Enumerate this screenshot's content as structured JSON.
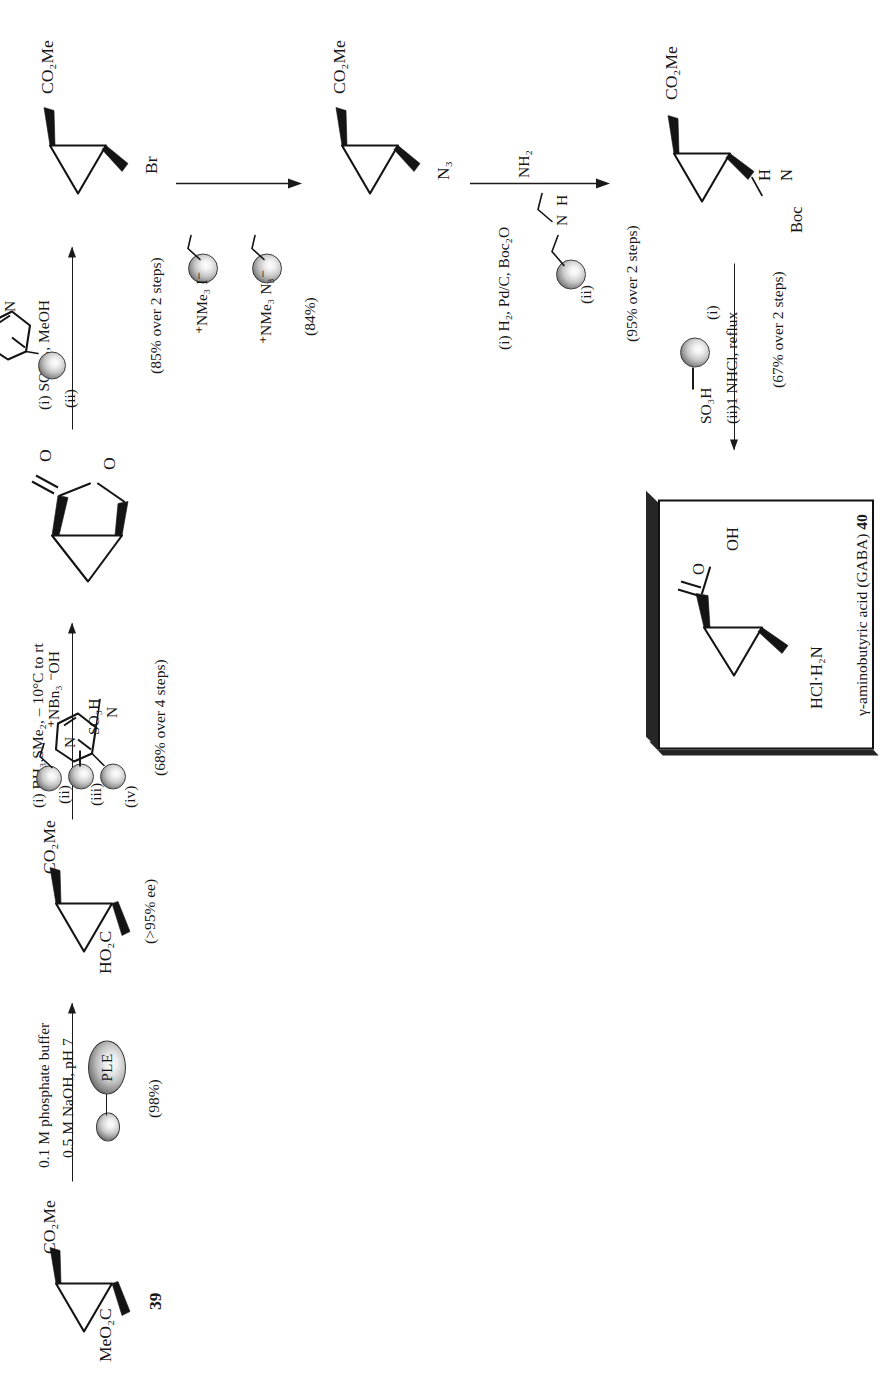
{
  "scheme": {
    "type": "reaction-scheme",
    "title": "Solid-phase synthesis of a GABA analogue",
    "orientation_deg": -90,
    "compounds": [
      {
        "id": "39",
        "label": "39",
        "name": "dimethyl cyclopropane-1,2-dicarboxylate",
        "left_substituent": "MeO2C",
        "right_substituent": "CO2Me",
        "left_substituent_html": "MeO<sub>2</sub>C",
        "right_substituent_html": "CO<sub>2</sub>Me"
      },
      {
        "id": "monoacid",
        "label": "",
        "name": "cyclopropane mono-acid mono-ester",
        "left_substituent": "HO2C",
        "right_substituent": "CO2Me",
        "left_substituent_html": "HO<sub>2</sub>C",
        "right_substituent_html": "CO<sub>2</sub>Me",
        "note": "(>95% ee)"
      },
      {
        "id": "lactone",
        "label": "",
        "name": "bicyclic lactone",
        "atoms": [
          "O",
          "O"
        ]
      },
      {
        "id": "bromide",
        "label": "",
        "name": "bromomethyl cyclopropane ester",
        "left_substituent": "Br",
        "right_substituent": "CO2Me",
        "left_substituent_html": "Br",
        "right_substituent_html": "CO<sub>2</sub>Me"
      },
      {
        "id": "azide",
        "label": "",
        "name": "azidomethyl cyclopropane ester",
        "left_substituent": "N3",
        "right_substituent": "CO2Me",
        "left_substituent_html": "N<sub>3</sub>",
        "right_substituent_html": "CO<sub>2</sub>Me"
      },
      {
        "id": "boc",
        "label": "",
        "name": "Boc-protected aminomethyl cyclopropane ester",
        "left_substituent": "Boc-NH",
        "right_substituent": "CO2Me",
        "left_substituent_html": "Boc<span class='nh'>N</span>H",
        "right_substituent_html": "CO<sub>2</sub>Me"
      },
      {
        "id": "40",
        "label": "40",
        "name": "gamma-aminobutyric acid (GABA)",
        "caption": "γ-aminobutyric acid (GABA) 40",
        "caption_plain": "γ-aminobutyric acid (GABA)",
        "caption_number": "40",
        "left_substituent": "HCl·H2N",
        "left_substituent_html": "HCl·H<sub>2</sub>N",
        "acid_group_O": "O",
        "acid_group_OH": "OH"
      }
    ],
    "steps": [
      {
        "index": 1,
        "from": "39",
        "to": "monoacid",
        "direction": "right",
        "reagents_above": [
          "0.1 M phosphate buffer",
          "0.5 M NaOH, pH 7"
        ],
        "reagent_resin": {
          "kind": "enzyme-bead",
          "enzyme_label": "PLE"
        },
        "yield": "(98%)",
        "product_note": "(>95% ee)"
      },
      {
        "index": 2,
        "from": "monoacid",
        "to": "lactone",
        "direction": "right",
        "reagents_above": [
          "(i) BH₃.SMe₂, – 10°C to rt"
        ],
        "reagents_list": [
          {
            "roman": "(ii)",
            "resin": "bead",
            "tag": "⁺NBn₃ ⁻OH",
            "tag_html": "<sup>+</sup>NBn<sub>3</sub> <sup>−</sup>OH"
          },
          {
            "roman": "(iii)",
            "resin": "bead",
            "tag": "SO₃H",
            "tag_html": "SO<sub>3</sub>H"
          },
          {
            "roman": "(iv)",
            "resin": "bead",
            "tag": "pyridin-4-ylamino (DMAP-type)",
            "tag_html": "N—"
          }
        ],
        "yield": "(68% over 4 steps)"
      },
      {
        "index": 3,
        "from": "lactone",
        "to": "bromide",
        "direction": "right",
        "reagents_above": [
          "(i) SOBr₂, MeOH"
        ],
        "reagents_list": [
          {
            "roman": "(ii)",
            "resin": "bead",
            "tag": "4-pyridyl",
            "tag_html": "pyridine"
          }
        ],
        "yield": "(85% over 2 steps)"
      },
      {
        "index": 4,
        "from": "bromide",
        "to": "azide",
        "direction": "down",
        "reagents_list": [
          {
            "roman": "",
            "resin": "bead",
            "tag": "⁺NMe₃ I⁻",
            "tag_html": "<sup>+</sup>NMe<sub>3</sub> I<sup>−</sup>"
          },
          {
            "roman": "",
            "resin": "bead",
            "tag": "⁺NMe₃ N₃⁻",
            "tag_html": "<sup>+</sup>NMe<sub>3</sub> N<sub>3</sub><sup>−</sup>"
          }
        ],
        "yield": "(84%)"
      },
      {
        "index": 5,
        "from": "azide",
        "to": "boc",
        "direction": "down",
        "reagents_above": [
          "(i) H₂, Pd/C, Boc₂O"
        ],
        "reagents_list": [
          {
            "roman": "(ii)",
            "resin": "bead",
            "tag": "diethylenetriamine resin",
            "tag_html": "N(H)CH₂CH₂NH₂"
          }
        ],
        "yield": "(95% over 2 steps)"
      },
      {
        "index": 6,
        "from": "boc",
        "to": "40",
        "direction": "right",
        "reagents_list": [
          {
            "roman": "(i)",
            "resin": "bead",
            "tag": "SO₃H",
            "tag_html": "SO<sub>3</sub>H"
          },
          {
            "roman": "(ii)",
            "resin": "none",
            "tag": "1 NHCl, reflux",
            "tag_html": "1 NHCl, reflux"
          }
        ],
        "reagents_below": [
          "(ii)1 NHCl, reflux"
        ],
        "yield": "(67% over 2 steps)"
      }
    ],
    "labels": {
      "step1_line1": "0.1 M phosphate buffer",
      "step1_line2": "0.5 M NaOH, pH 7",
      "step1_enzyme": "PLE",
      "step1_yield": "(98%)",
      "cmpd39": "39",
      "meo2c": "MeO₂C",
      "co2me": "CO₂Me",
      "ho2c": "HO₂C",
      "ee_note": "(>95% ee)",
      "step2_i": "(i) BH₃.SMe₂, – 10°C to rt",
      "step2_ii": "(ii)",
      "step2_iii": "(iii)",
      "step2_iv": "(iv)",
      "nbn3oh": "⁺NBn₃ ⁻OH",
      "so3h": "SO₃H",
      "step2_yield": "(68% over 4 steps)",
      "step3_i": "(i) SOBr₂, MeOH",
      "step3_ii": "(ii)",
      "step3_yield": "(85% over 2 steps)",
      "br": "Br",
      "nme3i": "⁺NMe₃ I⁻",
      "nme3n3": "⁺NMe₃ N₃⁻",
      "step4_yield": "(84%)",
      "n3": "N₃",
      "step5_i": "(i) H₂, Pd/C, Boc₂O",
      "step5_ii": "(ii)",
      "nh2": "NH₂",
      "n_atom": "N",
      "h_atom": "H",
      "step5_yield": "(95% over 2 steps)",
      "boc": "Boc",
      "step6_i": "(i)",
      "step6_ii": "(ii)1 NHCl, reflux",
      "step6_yield": "(67% over 2 steps)",
      "hcl_h2n": "HCl·H₂N",
      "oh": "OH",
      "o_atom": "O",
      "gaba_caption": "γ-aminobutyric acid (GABA)",
      "gaba_number": "40"
    },
    "colors": {
      "ink": "#171717",
      "paper": "#ffffff",
      "bead_dark": "#2b2b2b",
      "bead_light": "#fdfdfd",
      "box_shadow": "#262626"
    }
  }
}
